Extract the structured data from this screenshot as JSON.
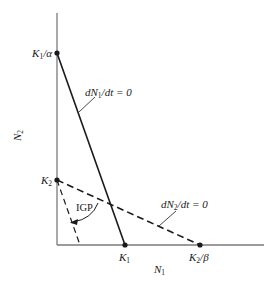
{
  "figure": {
    "type": "Lotka-Volterra competition phase plane",
    "colors": {
      "axis": "#7a7a7a",
      "line": "#1a1a1a",
      "background": "#ffffff"
    }
  },
  "axes": {
    "x_label": {
      "main": "N",
      "sub": "1"
    },
    "y_label": {
      "main": "N",
      "sub": "2"
    }
  },
  "points": {
    "k1_over_alpha": {
      "main": "K",
      "sub": "1",
      "tail": "/α"
    },
    "k2": {
      "main": "K",
      "sub": "2",
      "tail": ""
    },
    "k1": {
      "main": "K",
      "sub": "1",
      "tail": ""
    },
    "k2_over_beta": {
      "main": "K",
      "sub": "2",
      "tail": "/β"
    }
  },
  "isoclines": {
    "n1": {
      "pre": "dN",
      "sub": "1",
      "post": "/dt = 0",
      "style": "solid"
    },
    "n2": {
      "pre": "dN",
      "sub": "2",
      "post": "/dt = 0",
      "style": "dashed"
    }
  },
  "annotation": {
    "igp": "IGP"
  }
}
